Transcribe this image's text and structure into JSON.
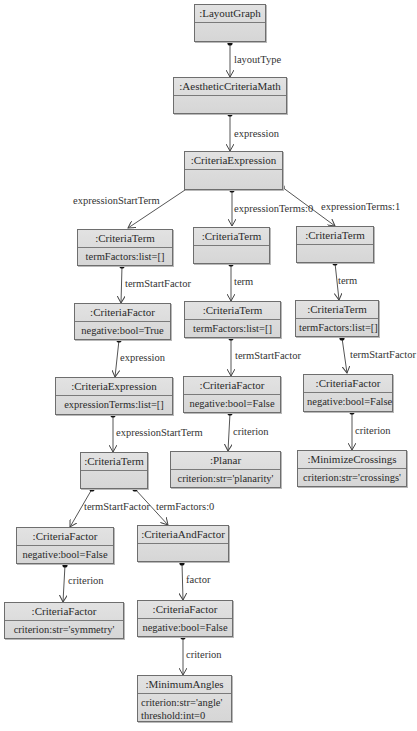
{
  "diagram": {
    "type": "UML object diagram",
    "nodes": {
      "layoutGraph": {
        "title": ":LayoutGraph",
        "attrs": []
      },
      "aestheticCriteriaMath": {
        "title": ":AestheticCriteriaMath",
        "attrs": []
      },
      "criteriaExpression": {
        "title": ":CriteriaExpression",
        "attrs": []
      },
      "criteriaTermA": {
        "title": ":CriteriaTerm",
        "attrs": [
          "termFactors:list=[]"
        ]
      },
      "criteriaTermB": {
        "title": ":CriteriaTerm",
        "attrs": []
      },
      "criteriaTermC": {
        "title": ":CriteriaTerm",
        "attrs": []
      },
      "criteriaFactorA": {
        "title": ":CriteriaFactor",
        "attrs": [
          "negative:bool=True"
        ]
      },
      "criteriaTermB2": {
        "title": ":CriteriaTerm",
        "attrs": [
          "termFactors:list=[]"
        ]
      },
      "criteriaTermC2": {
        "title": ":CriteriaTerm",
        "attrs": [
          "termFactors:list=[]"
        ]
      },
      "criteriaExpressionInner": {
        "title": ":CriteriaExpression",
        "attrs": [
          "expressionTerms:list=[]"
        ]
      },
      "criteriaFactorB": {
        "title": ":CriteriaFactor",
        "attrs": [
          "negative:bool=False"
        ]
      },
      "criteriaFactorC": {
        "title": ":CriteriaFactor",
        "attrs": [
          "negative:bool=False"
        ]
      },
      "planar": {
        "title": ":Planar",
        "attrs": [
          "criterion:str='planarity'"
        ]
      },
      "minimizeCrossings": {
        "title": ":MinimizeCrossings",
        "attrs": [
          "criterion:str='crossings'"
        ]
      },
      "criteriaTermInner": {
        "title": ":CriteriaTerm",
        "attrs": []
      },
      "criteriaFactorD": {
        "title": ":CriteriaFactor",
        "attrs": [
          "negative:bool=False"
        ]
      },
      "criteriaAndFactor": {
        "title": ":CriteriaAndFactor",
        "attrs": []
      },
      "criteriaFactorSym": {
        "title": ":CriteriaFactor",
        "attrs": [
          "criterion:str='symmetry'"
        ]
      },
      "criteriaFactorE": {
        "title": ":CriteriaFactor",
        "attrs": [
          "negative:bool=False"
        ]
      },
      "minimumAngles": {
        "title": ":MinimumAngles",
        "attrs": [
          "criterion:str='angle'",
          "threshold:int=0"
        ]
      }
    },
    "edges": [
      {
        "from": "layoutGraph",
        "to": "aestheticCriteriaMath",
        "label": "layoutType"
      },
      {
        "from": "aestheticCriteriaMath",
        "to": "criteriaExpression",
        "label": "expression"
      },
      {
        "from": "criteriaExpression",
        "to": "criteriaTermA",
        "label": "expressionStartTerm"
      },
      {
        "from": "criteriaExpression",
        "to": "criteriaTermB",
        "label": "expressionTerms:0"
      },
      {
        "from": "criteriaExpression",
        "to": "criteriaTermC",
        "label": "expressionTerms:1"
      },
      {
        "from": "criteriaTermA",
        "to": "criteriaFactorA",
        "label": "termStartFactor"
      },
      {
        "from": "criteriaTermB",
        "to": "criteriaTermB2",
        "label": "term"
      },
      {
        "from": "criteriaTermC",
        "to": "criteriaTermC2",
        "label": "term"
      },
      {
        "from": "criteriaFactorA",
        "to": "criteriaExpressionInner",
        "label": "expression"
      },
      {
        "from": "criteriaTermB2",
        "to": "criteriaFactorB",
        "label": "termStartFactor"
      },
      {
        "from": "criteriaTermC2",
        "to": "criteriaFactorC",
        "label": "termStartFactor"
      },
      {
        "from": "criteriaExpressionInner",
        "to": "criteriaTermInner",
        "label": "expressionStartTerm"
      },
      {
        "from": "criteriaFactorB",
        "to": "planar",
        "label": "criterion"
      },
      {
        "from": "criteriaFactorC",
        "to": "minimizeCrossings",
        "label": "criterion"
      },
      {
        "from": "criteriaTermInner",
        "to": "criteriaFactorD",
        "label": "termStartFactor"
      },
      {
        "from": "criteriaTermInner",
        "to": "criteriaAndFactor",
        "label": "termFactors:0"
      },
      {
        "from": "criteriaFactorD",
        "to": "criteriaFactorSym",
        "label": "criterion"
      },
      {
        "from": "criteriaAndFactor",
        "to": "criteriaFactorE",
        "label": "factor"
      },
      {
        "from": "criteriaFactorE",
        "to": "minimumAngles",
        "label": "criterion"
      }
    ]
  }
}
